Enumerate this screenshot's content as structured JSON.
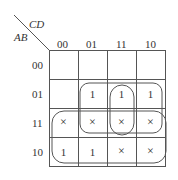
{
  "kmap": {
    "row_var": "AB",
    "col_var": "CD",
    "col_labels": [
      "00",
      "01",
      "11",
      "10"
    ],
    "row_labels": [
      "00",
      "01",
      "11",
      "10"
    ],
    "cells": [
      [
        "",
        "",
        "",
        ""
      ],
      [
        "",
        "1",
        "1",
        "1"
      ],
      [
        "×",
        "×",
        "×",
        "×"
      ],
      [
        "1",
        "1",
        "×",
        "×"
      ]
    ],
    "groups": [
      {
        "name": "rows-01-11-cols-01-10",
        "description": "2x3 loop covering rows 01,11 and columns 01,11,10"
      },
      {
        "name": "col-11-rows-01-11",
        "description": "vertical loop on column 11, rows 01 and 11"
      },
      {
        "name": "rows-11-10-all-cols",
        "description": "2x4 loop covering rows 11 and 10 across all columns"
      }
    ],
    "colors": {
      "line": "#555555",
      "text": "#333333"
    }
  }
}
